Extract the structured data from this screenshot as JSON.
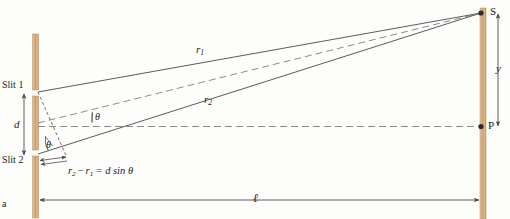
{
  "figure": {
    "panel_letter": "a",
    "caption_context": "double-slit interference geometry"
  },
  "colors": {
    "barrier": "#cfa172",
    "barrier_light": "#e8cfae",
    "line": "#4a4a4a",
    "dashed": "#6b6b6b",
    "text": "#1b1b1b"
  },
  "barriers": {
    "slit_screen_name": "slit-barrier",
    "viewing_screen_name": "viewing-screen"
  },
  "labels": {
    "slit1": "Slit 1",
    "slit2": "Slit 2",
    "point_s": "S",
    "point_p": "P",
    "separation_d": "d",
    "distance_y": "y",
    "distance_l": "ℓ",
    "theta_upper": "θ",
    "theta_lower": "θ",
    "panel": "a"
  },
  "rays": {
    "r1": {
      "symbol": "r",
      "subscript": "1",
      "display": "r₁",
      "style": "solid",
      "from": "Slit 1",
      "to": "S"
    },
    "r2": {
      "symbol": "r",
      "subscript": "2",
      "display": "r₂",
      "style": "solid",
      "from": "Slit 2",
      "to": "S"
    },
    "center_ray": {
      "display": "",
      "style": "dashed",
      "from": "midpoint between slits",
      "to": "S"
    },
    "axis": {
      "display": "",
      "style": "dashed",
      "from": "midpoint between slits",
      "to": "P"
    }
  },
  "equation": {
    "lhs_first_symbol": "r",
    "lhs_first_sub": "2",
    "minus": "−",
    "lhs_second_symbol": "r",
    "lhs_second_sub": "1",
    "equals": "=",
    "rhs": "d sin θ",
    "full": "r₂ − r₁ = d sin θ"
  },
  "dimensions": {
    "d_description": "slit separation",
    "y_description": "distance from central point P up to point S on screen",
    "l_description": "distance from slit barrier to viewing screen"
  }
}
